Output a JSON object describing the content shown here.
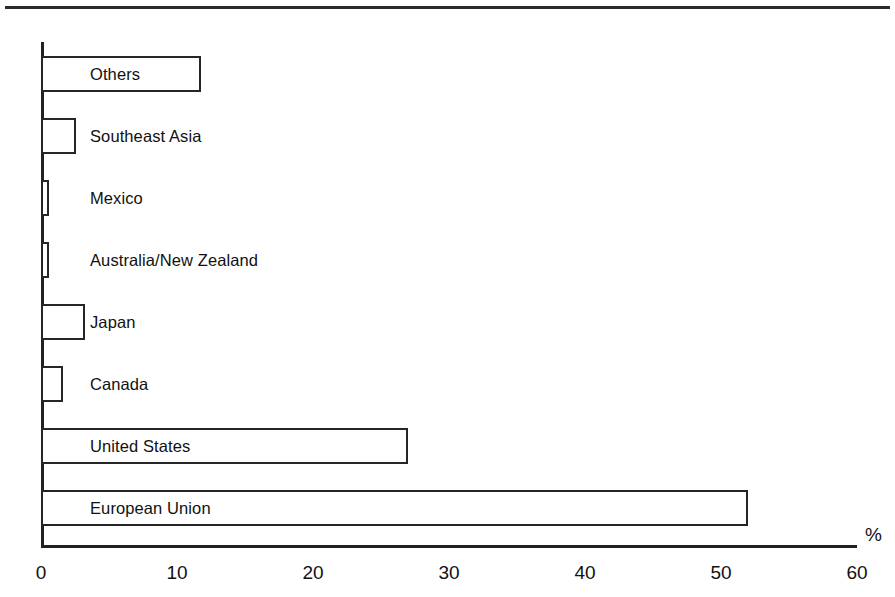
{
  "chart_data": {
    "type": "bar",
    "orientation": "horizontal",
    "title": "",
    "subtitle": "",
    "xlabel": "%",
    "ylabel": "",
    "categories": [
      "Others",
      "Southeast Asia",
      "Mexico",
      "Australia/New Zealand",
      "Japan",
      "Canada",
      "United States",
      "European Union"
    ],
    "values": [
      11.8,
      2.6,
      0.6,
      0.6,
      3.2,
      1.6,
      27.0,
      52.0
    ],
    "xlim": [
      0,
      60
    ],
    "xticks": [
      0,
      10,
      20,
      30,
      40,
      50,
      60
    ],
    "xtick_labels": [
      "0",
      "10",
      "20",
      "30",
      "40",
      "50",
      "60"
    ],
    "grid": false,
    "legend": null,
    "bar_fill": "#ffffff",
    "bar_edge": "#262626",
    "axis_color": "#222222"
  },
  "axis": {
    "unit_label": "%"
  }
}
